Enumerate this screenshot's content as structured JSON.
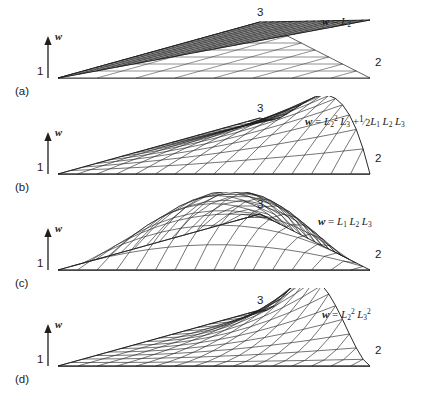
{
  "figure": {
    "kind": "four-panel-3d-surface-mesh",
    "background_color": "#ffffff",
    "line_color": "#1f1f1f",
    "panels": [
      {
        "tag": "(a)",
        "equation_plain": "w = L2",
        "equation_html": "<span class=\"v\">w</span> = <i>L</i><sub>2</sub>",
        "axis_label": "w",
        "vertex_labels": {
          "v1": "1",
          "v2": "2",
          "v3": "3"
        },
        "surface": {
          "type": "plane",
          "formula": "L2",
          "description": "linear area-coordinate shape function, planar ruled surface peaking along edge toward vertex 3"
        }
      },
      {
        "tag": "(b)",
        "equation_plain": "w = L2^2 L3 + 1/2 L1 L2 L3",
        "equation_html": "<span class=\"v\">w</span> = <i>L</i><sub>2</sub><sup>2</sup><span class=\"sp\"></span><i>L</i><sub>3</sub> +<span class=\"frac\"><sup>1</sup>&frasl;<sub>2</sub></span><i>L</i><sub>1</sub><span class=\"sp\"></span><i>L</i><sub>2</sub><span class=\"sp\"></span><i>L</i><sub>3</sub>",
        "axis_label": "w",
        "vertex_labels": {
          "v1": "1",
          "v2": "2",
          "v3": "3"
        },
        "surface": {
          "type": "cubic",
          "formula": "L2*L2*L3 + 0.5*L1*L2*L3",
          "description": "cubic bubble-augmented surface with a ridge peaking near vertex 3 side"
        }
      },
      {
        "tag": "(c)",
        "equation_plain": "w = L1 L2 L3",
        "equation_html": "<span class=\"v\">w</span> = <i>L</i><sub>1</sub><span class=\"sp\"></span><i>L</i><sub>2</sub><span class=\"sp\"></span><i>L</i><sub>3</sub>",
        "axis_label": "w",
        "vertex_labels": {
          "v1": "1",
          "v2": "2",
          "v3": "3"
        },
        "surface": {
          "type": "cubic-bubble",
          "formula": "L1*L2*L3",
          "description": "interior bubble function, zero on all three edges"
        }
      },
      {
        "tag": "(d)",
        "equation_plain": "w = L2^2 L3^2",
        "equation_html": "<span class=\"v\">w</span> = <i>L</i><sub>2</sub><sup>2</sup><span class=\"sp\"></span><i>L</i><sub>3</sub><sup>2</sup>",
        "axis_label": "w",
        "vertex_labels": {
          "v1": "1",
          "v2": "2",
          "v3": "3"
        },
        "surface": {
          "type": "quartic",
          "formula": "L2*L2*L3*L3",
          "description": "quartic surface with broad plateau along the 2-3 edge"
        }
      }
    ]
  }
}
